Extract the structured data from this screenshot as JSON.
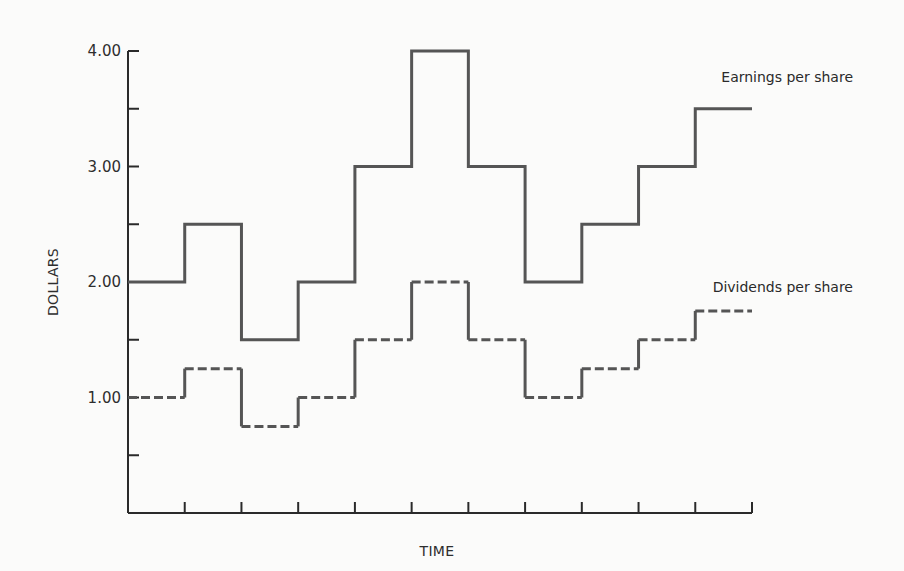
{
  "chart_data": {
    "type": "line",
    "subtype": "step",
    "title": "",
    "xlabel": "TIME",
    "ylabel": "DOLLARS",
    "ylim": [
      0,
      4
    ],
    "ytick_values": [
      0.5,
      1.0,
      1.5,
      2.0,
      2.5,
      3.0,
      3.5,
      4.0
    ],
    "ytick_labels": [
      {
        "value": 1.0,
        "label": "1.00"
      },
      {
        "value": 2.0,
        "label": "2.00"
      },
      {
        "value": 3.0,
        "label": "3.00"
      },
      {
        "value": 4.0,
        "label": "4.00"
      }
    ],
    "x_periods": 11,
    "x_tick_labels": [],
    "grid": false,
    "legend_position": "inline-right",
    "series": [
      {
        "name": "Earnings per share",
        "style": "solid",
        "values": [
          2.0,
          2.5,
          1.5,
          2.0,
          3.0,
          4.0,
          3.0,
          2.0,
          2.5,
          3.0,
          3.5
        ]
      },
      {
        "name": "Dividends per share",
        "style": "dashed",
        "values": [
          1.0,
          1.25,
          0.75,
          1.0,
          1.5,
          2.0,
          1.5,
          1.0,
          1.25,
          1.5,
          1.75
        ]
      }
    ]
  }
}
